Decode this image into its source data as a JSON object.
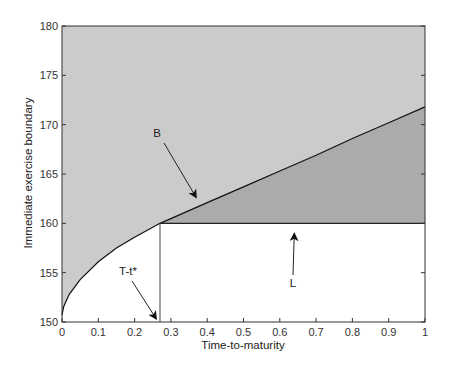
{
  "chart_data": {
    "type": "area",
    "title": "",
    "xlabel": "Time-to-maturity",
    "ylabel": "Immediate exercise boundary",
    "xlim": [
      0,
      1
    ],
    "ylim": [
      150,
      180
    ],
    "xticks": [
      0,
      0.1,
      0.2,
      0.3,
      0.4,
      0.5,
      0.6,
      0.7,
      0.8,
      0.9,
      1
    ],
    "xtick_labels": [
      "0",
      "0.1",
      "0.2",
      "0.3",
      "0.4",
      "0.5",
      "0.6",
      "0.7",
      "0.8",
      "0.9",
      "1"
    ],
    "yticks": [
      150,
      155,
      160,
      165,
      170,
      175,
      180
    ],
    "ytick_labels": [
      "150",
      "155",
      "160",
      "165",
      "170",
      "175",
      "180"
    ],
    "grid": false,
    "legend": null,
    "series": [
      {
        "name": "B (immediate exercise boundary)",
        "x": [
          0,
          0.005,
          0.02,
          0.05,
          0.1,
          0.15,
          0.2,
          0.25,
          0.27,
          0.4,
          0.5,
          0.6,
          0.7,
          0.8,
          0.9,
          1.0
        ],
        "y": [
          150.7,
          151.6,
          152.8,
          154.3,
          156.1,
          157.5,
          158.6,
          159.6,
          160.0,
          162.1,
          163.7,
          165.3,
          166.9,
          168.6,
          170.2,
          171.8
        ]
      },
      {
        "name": "L (lower level)",
        "x": [
          0.27,
          1.0
        ],
        "y": [
          160,
          160
        ]
      },
      {
        "name": "T-t* (vertical marker)",
        "x": [
          0.27,
          0.27
        ],
        "y": [
          150,
          160
        ]
      }
    ],
    "regions": [
      {
        "name": "above boundary",
        "fill": "#cbcbcb"
      },
      {
        "name": "between B and L",
        "fill": "#ababab"
      },
      {
        "name": "below boundary (continuation)",
        "fill": "#ffffff"
      }
    ],
    "annotations": [
      {
        "text": "B",
        "x": 0.26,
        "y": 168.9,
        "arrow_to": [
          0.37,
          162.6
        ]
      },
      {
        "text": "T-t*",
        "x": 0.19,
        "y": 155.1,
        "arrow_to": [
          0.26,
          150.3
        ]
      },
      {
        "text": "L",
        "x": 0.64,
        "y": 154.0,
        "arrow_to": [
          0.64,
          159.0
        ]
      }
    ]
  }
}
